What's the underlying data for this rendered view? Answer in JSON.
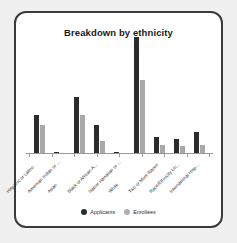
{
  "frame": {
    "border_color": "#3b3b3b",
    "background": "#ffffff"
  },
  "chart_data": {
    "type": "bar",
    "title": "Breakdown by ethnicity",
    "xlabel": "",
    "ylabel": "",
    "grid": false,
    "legend_position": "bottom",
    "ylim": [
      0,
      100
    ],
    "categories": [
      "Hispanic or Latino",
      "American Indian or ...",
      "Asian",
      "Black or African A...",
      "Native Hawaiian or ...",
      "White",
      "Two or More Races",
      "Race/Ethnicity Un...",
      "International Hisp..."
    ],
    "series": [
      {
        "name": "Applicants",
        "color": "#2b2b2b",
        "values": [
          33,
          1,
          48,
          24,
          1,
          100,
          14,
          12,
          18
        ]
      },
      {
        "name": "Enrollees",
        "color": "#a8a8a8",
        "values": [
          24,
          0,
          33,
          10,
          0,
          63,
          7,
          6,
          7
        ]
      }
    ]
  },
  "legend": {
    "items": [
      {
        "label": "Applicants",
        "color": "#2b2b2b"
      },
      {
        "label": "Enrollees",
        "color": "#b0b0b0"
      }
    ]
  }
}
